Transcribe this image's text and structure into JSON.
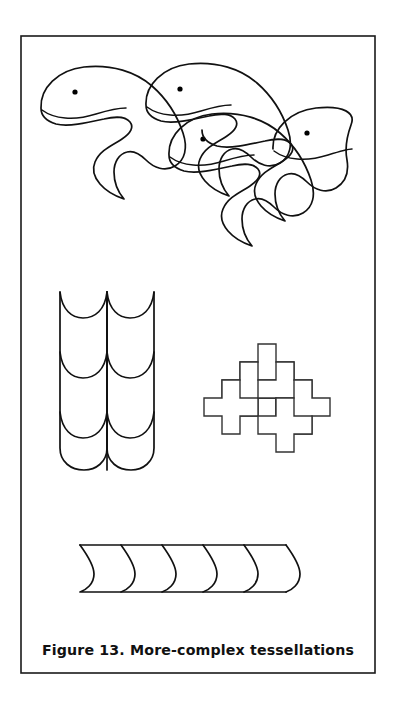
{
  "page": {
    "background_color": "#ffffff",
    "width": 394,
    "height": 707
  },
  "frame": {
    "name": "figure-border",
    "stroke_color": "#1a1a1a",
    "x": 21,
    "y": 36,
    "width": 354,
    "height": 637
  },
  "caption": {
    "text": "Figure 13.  More-complex tessellations",
    "figure_number": "Figure 13.",
    "title": "More-complex tessellations",
    "color": "#111111",
    "x": 198,
    "y": 655
  },
  "ink_color": "#111111",
  "panels": [
    {
      "id": "whale-tessellation",
      "label": "Whale tessellation",
      "type": "interlocking-creature",
      "count": 4,
      "facing": "left",
      "features": [
        "rounded-head",
        "dot-eye",
        "curved-mouth",
        "forked-tail"
      ],
      "bbox": [
        30,
        58,
        350,
        232
      ]
    },
    {
      "id": "fish-scale-tessellation",
      "label": "Fish-scale tessellation",
      "type": "scale-grid",
      "columns": 2,
      "rows": 3,
      "cell_width": 47,
      "cell_height": 60,
      "bbox": [
        60,
        290,
        155,
        470
      ]
    },
    {
      "id": "cross-tessellation",
      "label": "Interlocking cross tessellation",
      "type": "greek-cross-grid",
      "count": 6,
      "arm_size": 9,
      "bbox": [
        222,
        344,
        322,
        432
      ]
    },
    {
      "id": "wave-band-tessellation",
      "label": "S-curve wave band tessellation",
      "type": "s-curve-band",
      "repeats": 5,
      "bbox": [
        80,
        543,
        288,
        594
      ]
    }
  ],
  "whales": [
    {
      "id": "whale-top-left",
      "eye": {
        "x": 75,
        "y": 92
      }
    },
    {
      "id": "whale-top-right",
      "eye": {
        "x": 180,
        "y": 89
      }
    },
    {
      "id": "whale-bottom-left",
      "eye": {
        "x": 203,
        "y": 139
      }
    },
    {
      "id": "whale-bottom-right",
      "eye": {
        "x": 307,
        "y": 133
      }
    }
  ]
}
